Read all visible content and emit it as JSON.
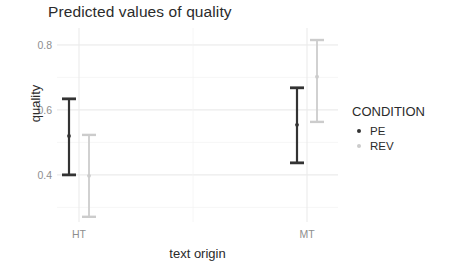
{
  "chart_data": {
    "type": "scatter",
    "title": "Predicted values of quality",
    "xlabel": "text origin",
    "ylabel": "quality",
    "categories": [
      "HT",
      "MT"
    ],
    "x_tick_labels": [
      "HT",
      "MT"
    ],
    "y_tick_labels": [
      "0.4",
      "0.6",
      "0.8"
    ],
    "y_ticks": [
      0.4,
      0.6,
      0.8
    ],
    "ylim": [
      0.255,
      0.852
    ],
    "grid": true,
    "grid_color": "#f2f2f2",
    "panel_background": "#ffffff",
    "legend_position": "right",
    "legend_title": "CONDITION",
    "series": [
      {
        "name": "PE",
        "color": "#333333",
        "values": [
          0.52,
          0.554
        ],
        "ci_lower": [
          0.4,
          0.437
        ],
        "ci_upper": [
          0.634,
          0.668
        ]
      },
      {
        "name": "REV",
        "color": "#cccccc",
        "values": [
          0.397,
          0.702
        ],
        "ci_lower": [
          0.271,
          0.563
        ],
        "ci_upper": [
          0.523,
          0.815
        ]
      }
    ]
  },
  "legend": {
    "title": "CONDITION",
    "items": [
      {
        "label": "PE",
        "color": "#333333",
        "icon": "dot-icon"
      },
      {
        "label": "REV",
        "color": "#cccccc",
        "icon": "dot-icon"
      }
    ]
  },
  "axes": {
    "y_title": "quality",
    "x_title": "text origin",
    "y_ticks": [
      {
        "label": "0.8",
        "value": 0.8
      },
      {
        "label": "0.6",
        "value": 0.6
      },
      {
        "label": "0.4",
        "value": 0.4
      }
    ],
    "x_ticks": [
      {
        "label": "HT",
        "value": 0
      },
      {
        "label": "MT",
        "value": 1
      }
    ]
  },
  "header": {
    "title": "Predicted values of quality"
  }
}
